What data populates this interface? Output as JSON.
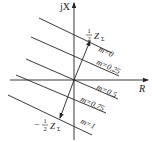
{
  "diagram": {
    "axes": {
      "y_label": "jX",
      "x_label": "R"
    },
    "vectors": {
      "positive_label_num": "1",
      "positive_label_den": "2",
      "positive_label_sym": "Z",
      "positive_label_sub": "Σ",
      "negative_label_sign": "−",
      "negative_label_num": "1",
      "negative_label_den": "2",
      "negative_label_sym": "Z",
      "negative_label_sub": "Σ"
    },
    "lines": [
      {
        "label": "m=0"
      },
      {
        "label": "m=0.25"
      },
      {
        "label": "m=0.5"
      },
      {
        "label": "m=0.75"
      },
      {
        "label": "m=1"
      }
    ],
    "colors": {
      "stroke": "#222222",
      "background": "#ffffff"
    }
  }
}
